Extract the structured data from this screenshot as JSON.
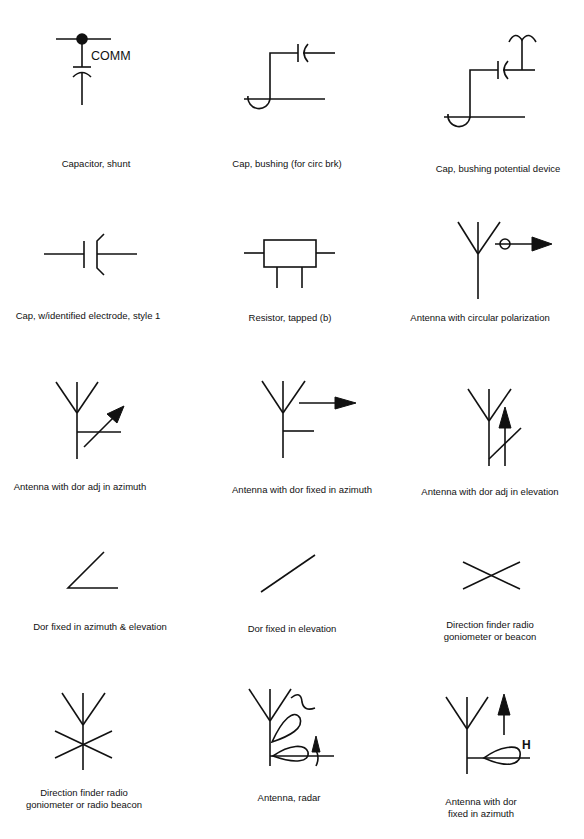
{
  "sheet": {
    "title": "Electrical / antenna schematic symbols",
    "stroke_color": "#111111",
    "background": "#ffffff"
  },
  "symbols": [
    {
      "label": "Capacitor, shunt",
      "annotation": "COMM"
    },
    {
      "label": "Cap, bushing (for circ brk)"
    },
    {
      "label": "Cap, bushing potential device"
    },
    {
      "label": "Cap, w/identified electrode, style 1"
    },
    {
      "label": "Resistor, tapped (b)"
    },
    {
      "label": "Antenna with circular polarization"
    },
    {
      "label": "Antenna with dor adj in azimuth"
    },
    {
      "label": "Antenna with dor fixed in azimuth"
    },
    {
      "label": "Antenna with dor adj in elevation"
    },
    {
      "label": "Dor fixed in azimuth & elevation"
    },
    {
      "label": "Dor fixed in  elevation"
    },
    {
      "label_line1": "Direction finder radio",
      "label_line2": "goniometer or beacon"
    },
    {
      "label_line1": "Direction finder radio",
      "label_line2": "goniometer or radio beacon"
    },
    {
      "label": "Antenna, radar"
    },
    {
      "label_line1": "Antenna with dor",
      "label_line2": "fixed in azimuth",
      "annotation": "H"
    }
  ]
}
